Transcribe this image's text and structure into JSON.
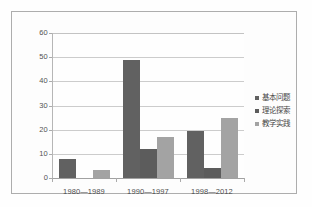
{
  "chart_data": {
    "type": "bar",
    "title": "",
    "subtitle": "",
    "xlabel": "",
    "ylabel": "",
    "ylim": [
      0,
      60
    ],
    "ytick_step": 10,
    "yticks": [
      "60",
      "50",
      "40",
      "30",
      "20",
      "10",
      "0"
    ],
    "grid": true,
    "legend_position": "right",
    "categories": [
      "1980—1989",
      "1990—1997",
      "1998—2012"
    ],
    "series": [
      {
        "name": "基本问题",
        "color": "#404040",
        "values": [
          8,
          49,
          19.5
        ]
      },
      {
        "name": "理论探索",
        "color": "#3a3a3a",
        "values": [
          0,
          12,
          4
        ]
      },
      {
        "name": "教学实践",
        "color": "#909090",
        "values": [
          3.5,
          17,
          25
        ]
      }
    ]
  },
  "colors": {
    "series_basic": "#404040",
    "series_theory": "#3a3a3a",
    "series_practice": "#909090",
    "gridline": "#c2c2c2",
    "axis": "#8e8e8e",
    "frame": "#9d9d9d",
    "background": "#ffffff",
    "text": "#1f1f1f"
  }
}
